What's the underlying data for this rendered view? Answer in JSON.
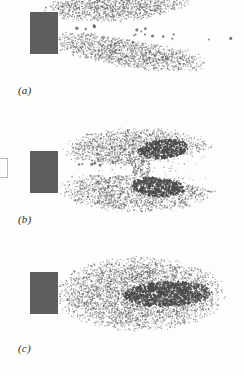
{
  "figure": {
    "background_color": "#fdfdfc",
    "nozzle_color": "#5e5e5e",
    "stipple_color": "#4a4a4a",
    "label_color": "#2a2a2a",
    "panels": [
      {
        "id": "a",
        "label": "(a)",
        "description": "Two stippled spray lobes splitting from nozzle with sparse droplets in the central gap",
        "nozzle": {
          "x": 30,
          "y": 12,
          "width": 28,
          "height": 42
        },
        "cores": [],
        "lobes": [
          {
            "name": "upper-lobe",
            "cx": 118,
            "cy": 6,
            "rx": 78,
            "ry": 16,
            "rotation": -4
          },
          {
            "name": "lower-lobe",
            "cx": 128,
            "cy": 52,
            "rx": 84,
            "ry": 16,
            "rotation": 9
          }
        ],
        "sparse_dots": 16
      },
      {
        "id": "b",
        "label": "(b)",
        "description": "Bilobed plume envelope with two dense elliptical cores and a narrow clear jet at the nozzle",
        "nozzle": {
          "x": 30,
          "y": 26,
          "width": 28,
          "height": 42
        },
        "cores": [
          {
            "name": "upper-core",
            "cx": 163,
            "cy": 24,
            "rx": 26,
            "ry": 10,
            "rotation": -4
          },
          {
            "name": "lower-core",
            "cx": 158,
            "cy": 62,
            "rx": 27,
            "ry": 10,
            "rotation": 4
          }
        ],
        "lobes": [
          {
            "name": "upper-lobe",
            "cx": 140,
            "cy": 26,
            "rx": 78,
            "ry": 24,
            "rotation": 0
          },
          {
            "name": "lower-lobe",
            "cx": 138,
            "cy": 63,
            "rx": 80,
            "ry": 25,
            "rotation": 0
          }
        ],
        "sparse_dots": 8
      },
      {
        "id": "c",
        "label": "(c)",
        "description": "Single bulbous plume envelope with one large dense elongated core",
        "nozzle": {
          "x": 30,
          "y": 22,
          "width": 28,
          "height": 42
        },
        "cores": [
          {
            "name": "central-core",
            "cx": 168,
            "cy": 44,
            "rx": 45,
            "ry": 13,
            "rotation": -2
          }
        ],
        "lobes": [
          {
            "name": "main-lobe",
            "cx": 140,
            "cy": 44,
            "rx": 88,
            "ry": 38,
            "rotation": 0
          }
        ],
        "sparse_dots": 0
      }
    ]
  }
}
